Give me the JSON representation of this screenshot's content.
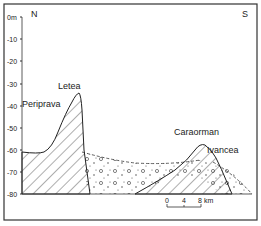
{
  "diagram": {
    "orientation": {
      "left": "N",
      "right": "S"
    },
    "y_axis": {
      "labels": [
        "0m",
        "-10",
        "-20",
        "-30",
        "-40",
        "-50",
        "-60",
        "-70",
        "-80"
      ]
    },
    "features": [
      {
        "name": "Periprava"
      },
      {
        "name": "Letea"
      },
      {
        "name": "Caraorman"
      },
      {
        "name": "Ivancea"
      }
    ],
    "scale_bar": {
      "ticks": [
        "0",
        "4",
        "8"
      ],
      "unit": "km"
    },
    "colors": {
      "line": "#222222",
      "frame": "#333333",
      "background": "#ffffff"
    }
  }
}
